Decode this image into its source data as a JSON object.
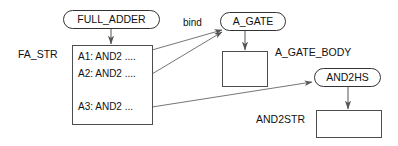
{
  "diagram": {
    "colors": {
      "background": "#ffffff",
      "stroke": "#4d4d4d",
      "text": "#111111",
      "edge": "#555555"
    },
    "nodes": [
      {
        "id": "full_adder",
        "label": "FULL_ADDER",
        "shape": "rounded-rect",
        "x": 63,
        "y": 10,
        "w": 97,
        "h": 19
      },
      {
        "id": "fa_str_box",
        "label": "",
        "shape": "rect",
        "x": 72,
        "y": 45,
        "w": 81,
        "h": 80
      },
      {
        "id": "a_gate",
        "label": "A_GATE",
        "shape": "rounded-rect",
        "x": 220,
        "y": 12,
        "w": 66,
        "h": 19
      },
      {
        "id": "a_gate_body_box",
        "label": "",
        "shape": "rect",
        "x": 222,
        "y": 51,
        "w": 46,
        "h": 36
      },
      {
        "id": "and2hs",
        "label": "AND2HS",
        "shape": "rounded-rect",
        "x": 314,
        "y": 68,
        "w": 67,
        "h": 19
      },
      {
        "id": "and2str_box",
        "label": "",
        "shape": "rect",
        "x": 316,
        "y": 110,
        "w": 66,
        "h": 28
      }
    ],
    "labels": [
      {
        "id": "fa_str",
        "text": "FA_STR",
        "x": 18,
        "y": 54
      },
      {
        "id": "a_gate_body",
        "text": "A_GATE_BODY",
        "x": 275,
        "y": 52
      },
      {
        "id": "and2str",
        "text": "AND2STR",
        "x": 256,
        "y": 119
      }
    ],
    "entries": [
      {
        "id": "a1",
        "text": "A1: AND2 ....",
        "x": 78,
        "y": 56
      },
      {
        "id": "a2",
        "text": "A2: AND2 ....",
        "x": 78,
        "y": 73
      },
      {
        "id": "a3",
        "text": "A3: AND2 ...",
        "x": 78,
        "y": 106
      }
    ],
    "edges": [
      {
        "id": "full-adder-to-fa-str",
        "label": "",
        "type": "arrow-down"
      },
      {
        "id": "a1-to-a-gate",
        "label": "bind",
        "type": "arrow"
      },
      {
        "id": "a2-to-a-gate",
        "label": "",
        "type": "arrow"
      },
      {
        "id": "a-gate-to-body",
        "label": "",
        "type": "arrow-down"
      },
      {
        "id": "a3-to-and2hs",
        "label": "",
        "type": "arrow"
      },
      {
        "id": "and2hs-to-and2str",
        "label": "",
        "type": "arrow-down"
      }
    ],
    "edge_labels": [
      {
        "id": "bind",
        "text": "bind",
        "x": 183,
        "y": 22
      }
    ]
  }
}
